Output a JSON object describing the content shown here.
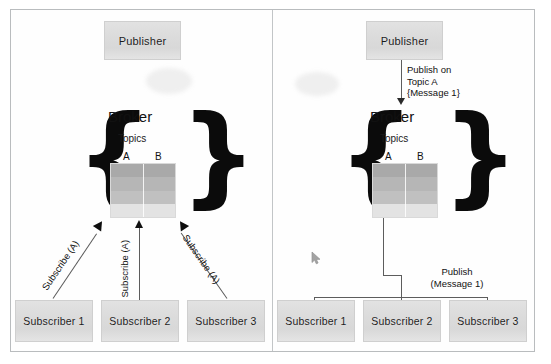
{
  "figure": {
    "panels": [
      {
        "id": "subscribe-phase",
        "publisher": {
          "label": "Publisher"
        },
        "broker": {
          "title": "Broker",
          "topics_label": "Topics",
          "topic_columns": [
            "A",
            "B"
          ],
          "brace_left": "{",
          "brace_right": "}"
        },
        "subscribers": [
          {
            "label": "Subscriber 1"
          },
          {
            "label": "Subscriber 2"
          },
          {
            "label": "Subscriber 3"
          }
        ],
        "edges": [
          {
            "label": "Subscribe (A)"
          },
          {
            "label": "Subscribe (A)"
          },
          {
            "label": "Subscribe (A)"
          }
        ]
      },
      {
        "id": "publish-phase",
        "publisher": {
          "label": "Publisher"
        },
        "broker": {
          "title": "Broker",
          "topics_label": "Topics",
          "topic_columns": [
            "A",
            "B"
          ],
          "brace_left": "{",
          "brace_right": "}"
        },
        "subscribers": [
          {
            "label": "Subscriber 1"
          },
          {
            "label": "Subscriber 2"
          },
          {
            "label": "Subscriber 3"
          }
        ],
        "edges": [
          {
            "label": "Publish on\nTopic A\n{Message 1}"
          },
          {
            "label": "Publish\n(Message 1)"
          }
        ]
      }
    ]
  },
  "colors": {
    "box_fill": "#dcdcdc",
    "box_border": "#cfcfcf",
    "frame_border": "#b9bcbe",
    "line": "#5d5d5d",
    "arrow": "#111111",
    "topic_row_1": "#a9a9a9",
    "topic_row_2": "#b6b6b6",
    "topic_row_3": "#c0c0c0",
    "topic_row_4": "#e3e3e3"
  }
}
